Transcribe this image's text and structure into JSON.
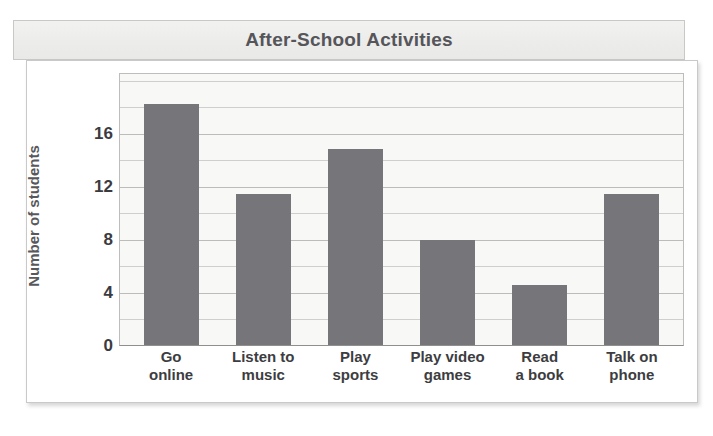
{
  "header": {
    "title": "After-School Activities"
  },
  "chart_data": {
    "type": "bar",
    "title": "After-School Activities",
    "xlabel": "",
    "ylabel": "Number of students",
    "categories": [
      "Go online",
      "Listen to music",
      "Play sports",
      "Play video games",
      "Read a book",
      "Talk on phone"
    ],
    "category_lines": [
      [
        "Go",
        "online"
      ],
      [
        "Listen to",
        "music"
      ],
      [
        "Play",
        "sports"
      ],
      [
        "Play video",
        "games"
      ],
      [
        "Read",
        "a book"
      ],
      [
        "Talk on",
        "phone"
      ]
    ],
    "values": [
      16,
      10,
      13,
      7,
      4,
      10
    ],
    "ylim": [
      0,
      18
    ],
    "yticks": [
      0,
      4,
      8,
      12,
      16
    ],
    "ytick_labels": [
      "0",
      "4",
      "8",
      "12",
      "16"
    ],
    "gridlines_every": 2,
    "grid": true,
    "legend": null,
    "bar_color": "#76767a",
    "plot_background": "#f8f8f6",
    "title_color": "#55555a",
    "grid_color": "#cfcfcd"
  }
}
